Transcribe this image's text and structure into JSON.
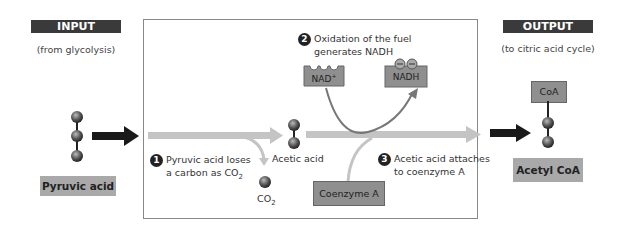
{
  "input": {
    "header": "INPUT",
    "subtitle": "(from glycolysis)",
    "molecule_label": "Pyruvic acid"
  },
  "output": {
    "header": "OUTPUT",
    "subtitle": "(to citric acid cycle)",
    "molecule_label": "Acetyl CoA",
    "coa_tag": "CoA"
  },
  "steps": [
    {
      "number": "1",
      "line1": "Pyruvic acid loses",
      "line2": "a carbon as CO",
      "sub": "2"
    },
    {
      "number": "2",
      "line1": "Oxidation of the fuel",
      "line2": "generates NADH"
    },
    {
      "number": "3",
      "line1": "Acetic acid attaches",
      "line2": "to coenzyme A"
    }
  ],
  "molecules": {
    "nad": "NAD",
    "nad_sup": "+",
    "nadh": "NADH",
    "acetic": "Acetic acid",
    "co2": "CO",
    "co2_sub": "2",
    "coenzyme": "Coenzyme A"
  },
  "colors": {
    "header_bg": "#3a3a3a",
    "label_bg": "#a9a9a9",
    "arrow_gray": "#c4c4c4",
    "arrow_black": "#1a1a1a",
    "box_gray": "#8f8f8f"
  }
}
